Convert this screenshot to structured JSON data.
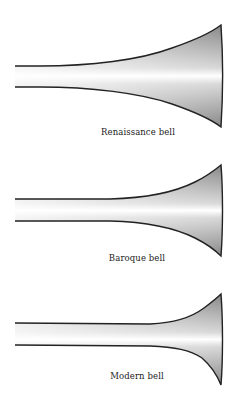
{
  "figure": {
    "bells": [
      {
        "name": "renaissance",
        "label": "Renaissance bell"
      },
      {
        "name": "baroque",
        "label": "Baroque bell"
      },
      {
        "name": "modern",
        "label": "Modern bell"
      }
    ],
    "colors": {
      "outline": "#222222",
      "fill_dark": "#7d7d7d",
      "fill_light": "#ffffff",
      "background": "#ffffff"
    }
  }
}
